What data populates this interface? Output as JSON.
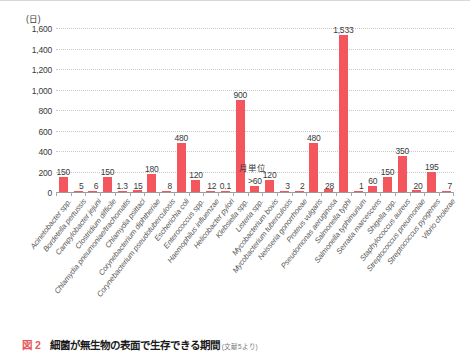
{
  "chart_data": {
    "type": "bar",
    "title": "",
    "unit_label": "(日)",
    "xlabel": "",
    "ylabel": "",
    "ylim": [
      0,
      1600
    ],
    "yticks": [
      "0",
      "200",
      "400",
      "600",
      "800",
      "1,000",
      "1,200",
      "1,400",
      "1,600"
    ],
    "ytick_values": [
      0,
      200,
      400,
      600,
      800,
      1000,
      1200,
      1400,
      1600
    ],
    "grid": true,
    "legend": "none",
    "bar_color": "#F4565E",
    "categories": [
      "Acinetobacter spp.",
      "Bordetella pertussis",
      "Campylobacter jejuni",
      "Clostridium difficile",
      "Chlamydia pneumoniae/trachomatis",
      "Chlamydia psittaci",
      "Corynebacterium diphtheriae",
      "Corynebacterium pseudotuberculosis",
      "Escherichia coli",
      "Enterococcus spp.",
      "Haemophilus influenzae",
      "Helicobacter pylori",
      "Klebsiella spp.",
      "Listeria spp.",
      "Mycobacterium bovis",
      "Mycobacterium tuberculosis",
      "Neisseria gonorrhoeae",
      "Proteus vulgaris",
      "Pseudomonas aeruginosa",
      "Salmonella typhi",
      "Salmonella typhimurium",
      "Serratia marcescens",
      "Shigella spp.",
      "Staphylococcus aureus",
      "Streptococcus pneumoniae",
      "Streptococcus pyogenes",
      "Vibrio cholerae"
    ],
    "values": [
      150,
      5,
      6,
      150,
      1.3,
      15,
      180,
      8,
      480,
      120,
      12,
      0.1,
      900,
      60,
      120,
      3,
      2,
      480,
      28,
      1533,
      1,
      60,
      150,
      350,
      20,
      195,
      7
    ],
    "value_labels": [
      "150",
      "5",
      "6",
      "150",
      "1.3",
      "15",
      "180",
      "8",
      "480",
      "120",
      "12",
      "0.1",
      "900",
      ">60",
      "120",
      "3",
      "2",
      "480",
      "28",
      "1,533",
      "1",
      "60",
      "150",
      "350",
      "20",
      "195",
      "7"
    ],
    "annotations": [
      {
        "text": "月単位",
        "near_category": "Listeria spp."
      }
    ]
  },
  "caption": {
    "figure_number": "図 2",
    "text": "細菌が無生物の表面で生存できる期間",
    "subtext": "(文献5より)"
  }
}
